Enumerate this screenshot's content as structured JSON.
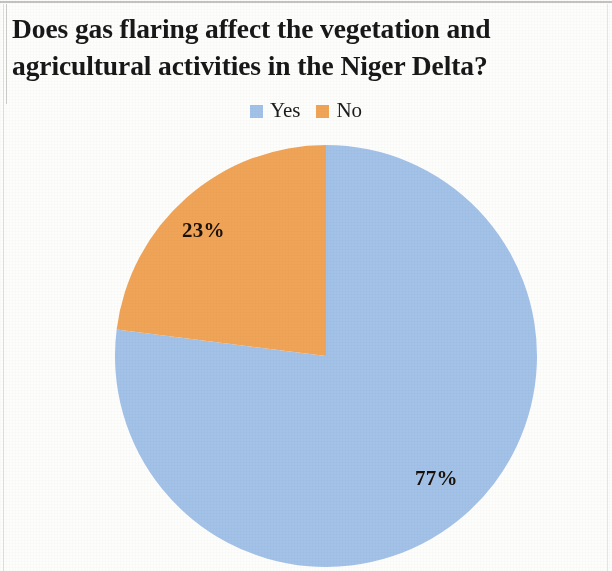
{
  "chart_data": {
    "type": "pie",
    "title": "Does gas flaring affect the vegetation and agricultural activities in the Niger Delta?",
    "title_lines": [
      "Does gas flaring affect the vegetation and",
      "agricultural activities in the Niger Delta?"
    ],
    "categories": [
      "Yes",
      "No"
    ],
    "values": [
      77,
      23
    ],
    "value_labels": [
      "77%",
      "23%"
    ],
    "unit": "%",
    "colors": [
      "#a3c2e8",
      "#f0a457"
    ],
    "legend": {
      "position": "top",
      "entries": [
        {
          "label": "Yes",
          "color": "#a3c2e8"
        },
        {
          "label": "No",
          "color": "#f0a457"
        }
      ]
    },
    "start_angle_deg": 0,
    "direction": "clockwise",
    "grid": false,
    "xlabel": "",
    "ylabel": ""
  },
  "title": {
    "line1": "Does gas flaring affect the vegetation and",
    "line2": "agricultural activities in the Niger Delta?"
  },
  "legend": {
    "yes_label": "Yes",
    "no_label": "No",
    "yes_color": "#a3c2e8",
    "no_color": "#f0a457"
  },
  "slices": {
    "yes_percent_label": "77%",
    "no_percent_label": "23%"
  }
}
